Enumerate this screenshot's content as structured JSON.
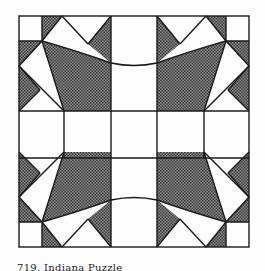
{
  "figure": {
    "caption": "719. Indiana Puzzle",
    "colors": {
      "background": "#fdfdfd",
      "line": "#1a1a1a",
      "shade_dark": "#6a6a6a",
      "shade_light": "#bdbdbd",
      "white": "#ffffff"
    },
    "grid": {
      "columns": 5,
      "rows": 5,
      "x_lines": [
        19,
        64,
        111,
        157,
        202,
        249
      ],
      "y_lines": [
        16,
        63,
        111,
        158,
        202,
        247
      ]
    }
  }
}
